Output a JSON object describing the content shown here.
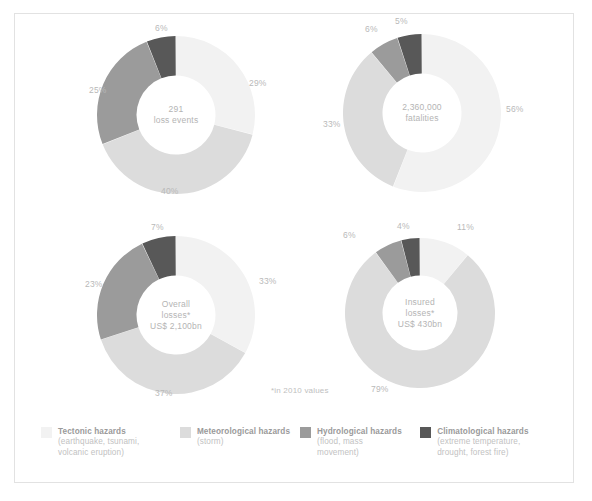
{
  "figure": {
    "footnote": "*in 2010 values",
    "border_color": "#e2e2e2",
    "background": "#ffffff"
  },
  "palette": {
    "tectonic": "#f2f2f2",
    "meteorological": "#dcdcdc",
    "hydrological": "#9b9b9b",
    "climatological": "#585858"
  },
  "legend": {
    "items": [
      {
        "key": "tectonic",
        "color": "#f2f2f2",
        "title": "Tectonic hazards",
        "subtitle": "(earthquake, tsunami,\nvolcanic eruption)"
      },
      {
        "key": "meteorological",
        "color": "#dcdcdc",
        "title": "Meteorological hazards",
        "subtitle": "(storm)"
      },
      {
        "key": "hydrological",
        "color": "#9b9b9b",
        "title": "Hydrological hazards",
        "subtitle": "(flood, mass\nmovement)"
      },
      {
        "key": "climatological",
        "color": "#585858",
        "title": "Climatological hazards",
        "subtitle": "(extreme temperature,\ndrought, forest fire)"
      }
    ]
  },
  "chart_data": [
    {
      "type": "pie",
      "id": "loss-events",
      "title": "291 loss events",
      "center_lines": [
        "291",
        "loss events"
      ],
      "categories": [
        "Tectonic hazards",
        "Meteorological hazards",
        "Hydrological hazards",
        "Climatological hazards"
      ],
      "values": [
        29,
        40,
        25,
        6
      ],
      "labels": [
        "29%",
        "40%",
        "25%",
        "6%"
      ],
      "colors": [
        "#f2f2f2",
        "#dcdcdc",
        "#9b9b9b",
        "#585858"
      ],
      "units": "percent"
    },
    {
      "type": "pie",
      "id": "fatalities",
      "title": "2,360,000 fatalities",
      "center_lines": [
        "2,360,000",
        "fatalities"
      ],
      "categories": [
        "Tectonic hazards",
        "Meteorological hazards",
        "Hydrological hazards",
        "Climatological hazards"
      ],
      "values": [
        56,
        33,
        6,
        5
      ],
      "labels": [
        "56%",
        "33%",
        "6%",
        "5%"
      ],
      "colors": [
        "#f2f2f2",
        "#dcdcdc",
        "#9b9b9b",
        "#585858"
      ],
      "units": "percent"
    },
    {
      "type": "pie",
      "id": "overall-losses",
      "title": "Overall losses* US$ 2,100bn",
      "center_lines": [
        "Overall",
        "losses*",
        "US$ 2,100bn"
      ],
      "categories": [
        "Tectonic hazards",
        "Meteorological hazards",
        "Hydrological hazards",
        "Climatological hazards"
      ],
      "values": [
        33,
        37,
        23,
        7
      ],
      "labels": [
        "33%",
        "37%",
        "23%",
        "7%"
      ],
      "colors": [
        "#f2f2f2",
        "#dcdcdc",
        "#9b9b9b",
        "#585858"
      ],
      "units": "percent"
    },
    {
      "type": "pie",
      "id": "insured-losses",
      "title": "Insured losses* US$ 430bn",
      "center_lines": [
        "Insured",
        "losses*",
        "US$ 430bn"
      ],
      "categories": [
        "Tectonic hazards",
        "Meteorological hazards",
        "Hydrological hazards",
        "Climatological hazards"
      ],
      "values": [
        11,
        79,
        6,
        4
      ],
      "labels": [
        "11%",
        "79%",
        "6%",
        "4%"
      ],
      "colors": [
        "#f2f2f2",
        "#dcdcdc",
        "#9b9b9b",
        "#585858"
      ],
      "units": "percent"
    }
  ],
  "charts_layout": [
    {
      "id": "loss-events",
      "left": 82,
      "top": 22,
      "size": 158,
      "hole": 0.5,
      "label_positions": [
        {
          "text_bind": 0,
          "left": 152,
          "top": 42
        },
        {
          "text_bind": 1,
          "left": 64,
          "top": 150
        },
        {
          "text_bind": 2,
          "left": -8,
          "top": 49
        },
        {
          "text_bind": 3,
          "left": 58,
          "top": -13
        }
      ]
    },
    {
      "id": "fatalities",
      "left": 328,
      "top": 20,
      "size": 158,
      "hole": 0.5,
      "label_positions": [
        {
          "text_bind": 0,
          "left": 163,
          "top": 70
        },
        {
          "text_bind": 1,
          "left": -20,
          "top": 85
        },
        {
          "text_bind": 2,
          "left": 22,
          "top": -10
        },
        {
          "text_bind": 3,
          "left": 52,
          "top": -18
        }
      ]
    },
    {
      "id": "overall-losses",
      "left": 82,
      "top": 222,
      "size": 158,
      "hole": 0.5,
      "label_positions": [
        {
          "text_bind": 0,
          "left": 162,
          "top": 40
        },
        {
          "text_bind": 1,
          "left": 58,
          "top": 152
        },
        {
          "text_bind": 2,
          "left": -12,
          "top": 43
        },
        {
          "text_bind": 3,
          "left": 54,
          "top": -14
        }
      ]
    },
    {
      "id": "insured-losses",
      "left": 330,
      "top": 224,
      "size": 150,
      "hole": 0.5,
      "label_positions": [
        {
          "text_bind": 0,
          "left": 112,
          "top": -16
        },
        {
          "text_bind": 1,
          "left": 26,
          "top": 146
        },
        {
          "text_bind": 2,
          "left": -2,
          "top": -8
        },
        {
          "text_bind": 3,
          "left": 52,
          "top": -17
        }
      ]
    }
  ]
}
